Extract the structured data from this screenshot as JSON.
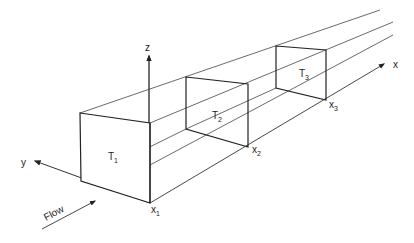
{
  "diagram": {
    "axes": {
      "x_label": "x",
      "y_label": "y",
      "z_label": "z"
    },
    "sections": [
      {
        "label": "T",
        "sub": "1",
        "position_label": "x",
        "position_sub": "1"
      },
      {
        "label": "T",
        "sub": "2",
        "position_label": "x",
        "position_sub": "2"
      },
      {
        "label": "T",
        "sub": "3",
        "position_label": "x",
        "position_sub": "3"
      }
    ],
    "flow_label": "Flow",
    "colors": {
      "line": "#333333",
      "background": "#ffffff"
    }
  }
}
